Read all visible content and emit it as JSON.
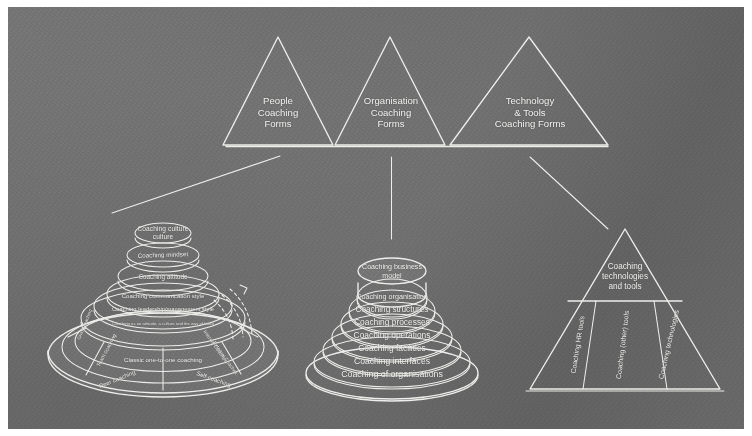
{
  "diagram": {
    "background_color": "#6f6f6f",
    "chalk_color": "#eeeeec",
    "top_triangles": [
      {
        "id": "people",
        "lines": [
          "People",
          "Coaching",
          "Forms"
        ]
      },
      {
        "id": "organisation",
        "lines": [
          "Organisation",
          "Coaching",
          "Forms"
        ]
      },
      {
        "id": "technology",
        "lines": [
          "Technology",
          "& Tools",
          "Coaching Forms"
        ]
      }
    ],
    "people_pyramid": {
      "tiers": [
        "Coaching culture",
        "Coaching mindset",
        "Coaching attitude",
        "Coaching communication style",
        "Coaching leadership/management style",
        "Coaching as an attitude, a culture and the way of living"
      ],
      "base_segments": [
        "Team coaching",
        "Classic one-to-one coaching",
        "Peer coaching",
        "Self-coaching",
        "Internal Coaches",
        "External Coaches",
        "Group coaching"
      ]
    },
    "organisation_pyramid": {
      "tiers": [
        "Coaching business model",
        "Coaching organisation",
        "Coaching structures",
        "Coaching processes",
        "Coaching operations",
        "Coaching facilities",
        "Coaching interfaces",
        "Coaching of organisations"
      ]
    },
    "technology_pyramid": {
      "apex": [
        "Coaching",
        "technologies",
        "and tools"
      ],
      "columns": [
        "Coaching HR tools",
        "Coaching (other) tools",
        "Coaching technologies"
      ]
    }
  }
}
